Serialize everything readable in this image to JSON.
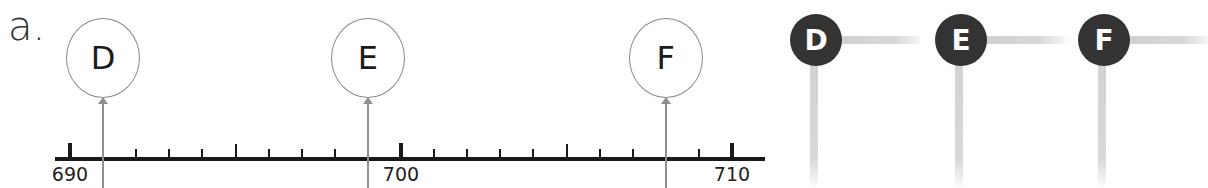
{
  "part_label": "a.",
  "number_line": {
    "min": 690,
    "max": 710,
    "step": 1,
    "labels": [
      {
        "value": 690,
        "text": "690"
      },
      {
        "value": 700,
        "text": "700"
      },
      {
        "value": 710,
        "text": "710"
      }
    ]
  },
  "balloons": [
    {
      "letter": "D",
      "value": 691
    },
    {
      "letter": "E",
      "value": 699
    },
    {
      "letter": "F",
      "value": 708
    }
  ],
  "answer_boxes": [
    {
      "letter": "D"
    },
    {
      "letter": "E"
    },
    {
      "letter": "F"
    }
  ],
  "colors": {
    "axis": "#1a1a1a",
    "balloon_outline": "#8a8a8a",
    "dot_fill": "#333333",
    "answer_line": "#d6d6d6"
  }
}
